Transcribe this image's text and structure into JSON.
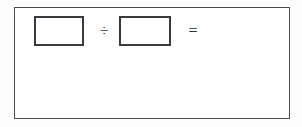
{
  "worksheet": {
    "panel": {
      "name": "division-exercise-panel",
      "border_color": "#4a4a52",
      "background_color": "#ffffff"
    },
    "equation": {
      "dividend": {
        "value": "",
        "placeholder": ""
      },
      "division_operator": "÷",
      "divisor": {
        "value": "",
        "placeholder": ""
      },
      "equals_operator": "=",
      "result": {
        "value": "",
        "placeholder": ""
      }
    },
    "work_area": {
      "content": ""
    },
    "colors": {
      "page_background": "#fdfdfd",
      "panel_background": "#ffffff",
      "frame_line": "#4a4a52",
      "box_line": "#3a3a42",
      "text": "#1a1a1a",
      "operator": "#2e2e34"
    }
  }
}
